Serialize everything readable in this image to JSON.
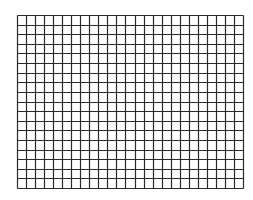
{
  "grid": {
    "columns": 25,
    "rows": 18,
    "line_color": "#2a2a2a",
    "background_color": "#ffffff",
    "line_width": 1.2
  }
}
